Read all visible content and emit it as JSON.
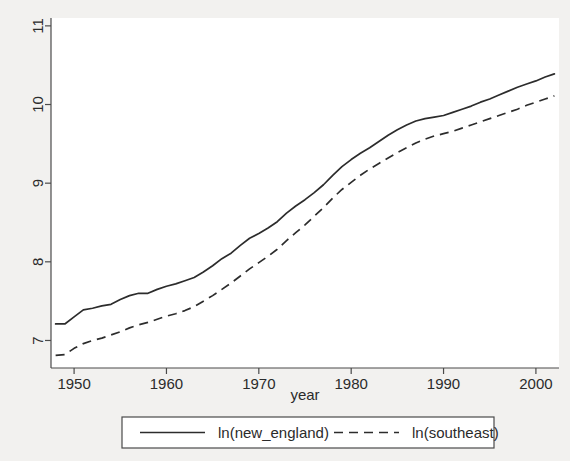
{
  "chart_data": {
    "type": "line",
    "title": "",
    "xlabel": "year",
    "ylabel": "",
    "xlim": [
      1947.5,
      2002.5
    ],
    "ylim": [
      6.65,
      11.1
    ],
    "grid": false,
    "legend_position": "bottom",
    "xticks": [
      "1950",
      "1960",
      "1970",
      "1980",
      "1990",
      "2000"
    ],
    "xtick_values": [
      1950,
      1960,
      1970,
      1980,
      1990,
      2000
    ],
    "yticks": [
      "7",
      "8",
      "9",
      "10",
      "11"
    ],
    "ytick_values": [
      7,
      8,
      9,
      10,
      11
    ],
    "x": [
      1948,
      1949,
      1950,
      1951,
      1952,
      1953,
      1954,
      1955,
      1956,
      1957,
      1958,
      1959,
      1960,
      1961,
      1962,
      1963,
      1964,
      1965,
      1966,
      1967,
      1968,
      1969,
      1970,
      1971,
      1972,
      1973,
      1974,
      1975,
      1976,
      1977,
      1978,
      1979,
      1980,
      1981,
      1982,
      1983,
      1984,
      1985,
      1986,
      1987,
      1988,
      1989,
      1990,
      1991,
      1992,
      1993,
      1994,
      1995,
      1996,
      1997,
      1998,
      1999,
      2000,
      2001,
      2002
    ],
    "series": [
      {
        "name": "ln(new_england)",
        "style": "solid",
        "values": [
          7.21,
          7.21,
          7.3,
          7.39,
          7.41,
          7.44,
          7.46,
          7.52,
          7.57,
          7.6,
          7.6,
          7.65,
          7.69,
          7.72,
          7.76,
          7.8,
          7.87,
          7.95,
          8.04,
          8.11,
          8.21,
          8.3,
          8.36,
          8.43,
          8.51,
          8.62,
          8.71,
          8.79,
          8.88,
          8.98,
          9.1,
          9.21,
          9.3,
          9.38,
          9.45,
          9.53,
          9.61,
          9.68,
          9.74,
          9.79,
          9.82,
          9.84,
          9.86,
          9.9,
          9.94,
          9.98,
          10.03,
          10.07,
          10.12,
          10.17,
          10.22,
          10.26,
          10.3,
          10.35,
          10.39
        ]
      },
      {
        "name": "ln(southeast)",
        "style": "dashed",
        "values": [
          6.81,
          6.82,
          6.9,
          6.96,
          7.0,
          7.03,
          7.07,
          7.11,
          7.16,
          7.2,
          7.23,
          7.27,
          7.31,
          7.34,
          7.38,
          7.43,
          7.5,
          7.57,
          7.65,
          7.73,
          7.82,
          7.91,
          7.99,
          8.07,
          8.16,
          8.27,
          8.37,
          8.47,
          8.58,
          8.69,
          8.81,
          8.92,
          9.01,
          9.1,
          9.18,
          9.25,
          9.32,
          9.39,
          9.45,
          9.51,
          9.56,
          9.6,
          9.63,
          9.66,
          9.7,
          9.74,
          9.78,
          9.82,
          9.86,
          9.9,
          9.94,
          9.99,
          10.03,
          10.07,
          10.11
        ]
      }
    ]
  },
  "legend": {
    "entries": [
      {
        "label": "ln(new_england)",
        "style": "solid"
      },
      {
        "label": "ln(southeast)",
        "style": "dashed"
      }
    ]
  },
  "colors": {
    "background": "#f2f1ef",
    "plot_background": "#ffffff",
    "line": "#2c2c2c",
    "axis": "#4a4a4a",
    "text": "#2b2b2b"
  }
}
